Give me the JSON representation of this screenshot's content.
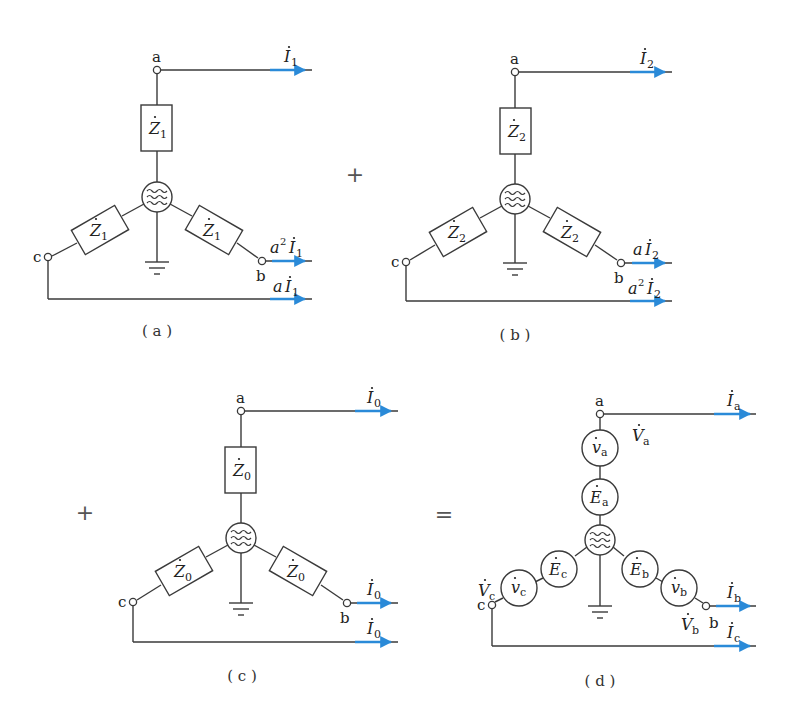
{
  "colors": {
    "arrow": "#2a8ad8",
    "line": "#3a3a3a"
  },
  "operators": {
    "plus1": "+",
    "plus2": "+",
    "equals": "="
  },
  "panels": [
    {
      "id": "a",
      "caption": "( a )",
      "node_labels": {
        "a": "a",
        "b": "b",
        "c": "c"
      },
      "impedances": {
        "a": {
          "main": "Z",
          "sub": "1"
        },
        "b": {
          "main": "Z",
          "sub": "1"
        },
        "c": {
          "main": "Z",
          "sub": "1"
        }
      },
      "currents": {
        "a": {
          "coef": "",
          "sup": "",
          "main": "I",
          "sub": "1"
        },
        "b": {
          "coef": "a",
          "sup": "2",
          "main": "I",
          "sub": "1"
        },
        "c": {
          "coef": "a",
          "sup": "",
          "main": "I",
          "sub": "1"
        }
      }
    },
    {
      "id": "b",
      "caption": "( b )",
      "node_labels": {
        "a": "a",
        "b": "b",
        "c": "c"
      },
      "impedances": {
        "a": {
          "main": "Z",
          "sub": "2"
        },
        "b": {
          "main": "Z",
          "sub": "2"
        },
        "c": {
          "main": "Z",
          "sub": "2"
        }
      },
      "currents": {
        "a": {
          "coef": "",
          "sup": "",
          "main": "I",
          "sub": "2"
        },
        "b": {
          "coef": "a",
          "sup": "",
          "main": "I",
          "sub": "2"
        },
        "c": {
          "coef": "a",
          "sup": "2",
          "main": "I",
          "sub": "2"
        }
      }
    },
    {
      "id": "c",
      "caption": "( c )",
      "node_labels": {
        "a": "a",
        "b": "b",
        "c": "c"
      },
      "impedances": {
        "a": {
          "main": "Z",
          "sub": "0"
        },
        "b": {
          "main": "Z",
          "sub": "0"
        },
        "c": {
          "main": "Z",
          "sub": "0"
        }
      },
      "currents": {
        "a": {
          "main": "I",
          "sub": "0"
        },
        "b": {
          "main": "I",
          "sub": "0"
        },
        "c": {
          "main": "I",
          "sub": "0"
        }
      }
    },
    {
      "id": "d",
      "caption": "( d )",
      "node_labels": {
        "a": "a",
        "b": "b",
        "c": "c"
      },
      "sources_v": {
        "a": {
          "main": "v",
          "sub": "a"
        },
        "b": {
          "main": "v",
          "sub": "b"
        },
        "c": {
          "main": "v",
          "sub": "c"
        }
      },
      "sources_e": {
        "a": {
          "main": "E",
          "sub": "a"
        },
        "b": {
          "main": "E",
          "sub": "b"
        },
        "c": {
          "main": "E",
          "sub": "c"
        }
      },
      "voltages": {
        "a": {
          "main": "V",
          "sub": "a"
        },
        "b": {
          "main": "V",
          "sub": "b"
        },
        "c": {
          "main": "V",
          "sub": "c"
        }
      },
      "currents": {
        "a": {
          "main": "I",
          "sub": "a"
        },
        "b": {
          "main": "I",
          "sub": "b"
        },
        "c": {
          "main": "I",
          "sub": "c"
        }
      }
    }
  ]
}
